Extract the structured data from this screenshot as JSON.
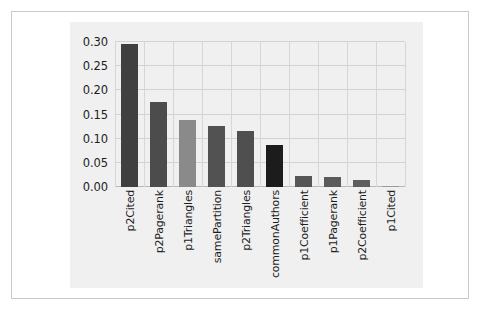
{
  "chart_data": {
    "type": "bar",
    "title": "",
    "xlabel": "",
    "ylabel": "",
    "ylim": [
      0.0,
      0.3
    ],
    "yticks": [
      "0.00",
      "0.05",
      "0.10",
      "0.15",
      "0.20",
      "0.25",
      "0.30"
    ],
    "ytick_values": [
      0.0,
      0.05,
      0.1,
      0.15,
      0.2,
      0.25,
      0.3
    ],
    "grid": true,
    "legend": "none",
    "categories": [
      "p2Cited",
      "p2Pagerank",
      "p1Triangles",
      "samePartition",
      "p2Triangles",
      "commonAuthors",
      "p1Coefficient",
      "p1Pagerank",
      "p2Coefficient",
      "p1Cited"
    ],
    "values": [
      0.295,
      0.175,
      0.138,
      0.127,
      0.115,
      0.086,
      0.023,
      0.021,
      0.014,
      0.002
    ],
    "bar_colors": [
      "#3f3f3f",
      "#4c4c4c",
      "#8a8a8a",
      "#525252",
      "#4f4f4f",
      "#1c1c1c",
      "#565656",
      "#5a5a5a",
      "#5e5e5e",
      "#9a9a9a"
    ]
  },
  "style": {
    "panel_background": "#f0f0f0",
    "page_background": "#ffffff",
    "frame_border": "#c9c9c9",
    "gridline_color": "#d2d2d2",
    "axis_color": "#b9b9b9",
    "tick_text_color": "#1d1d1d"
  }
}
